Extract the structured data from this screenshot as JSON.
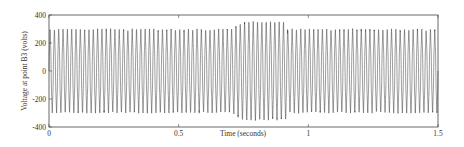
{
  "chart_data": {
    "type": "line",
    "title": "",
    "xlabel": "Time (seconds)",
    "ylabel": "Voltage at point B3 (volts)",
    "xlim": [
      0,
      1.5
    ],
    "ylim": [
      -400,
      400
    ],
    "xticks": [
      0,
      0.5,
      1,
      1.5
    ],
    "xtick_labels": [
      "0",
      "0.5",
      "1",
      "1.5"
    ],
    "yticks": [
      -400,
      -200,
      0,
      200,
      400
    ],
    "ytick_labels": [
      "-400",
      "-200",
      "0",
      "200",
      "400"
    ],
    "grid": false,
    "legend": null,
    "series": [
      {
        "name": "Voltage at point B3",
        "description": "Dense ~60 Hz sinusoidal waveform with a voltage swell between ~0.7 s and ~0.92 s",
        "frequency_hz": 60,
        "segments": [
          {
            "t_start": 0.0,
            "t_end": 0.7,
            "peak_amplitude": 280
          },
          {
            "t_start": 0.7,
            "t_end": 0.92,
            "peak_amplitude": 330
          },
          {
            "t_start": 0.92,
            "t_end": 1.5,
            "peak_amplitude": 280
          }
        ],
        "color": "#333333"
      }
    ]
  }
}
